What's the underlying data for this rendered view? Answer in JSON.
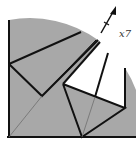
{
  "diagram": {
    "type": "origami-fold-step",
    "repeat_label": "x7",
    "colors": {
      "paper": "#a8a8a8",
      "line": "#111111",
      "crease": "#6e6e6e",
      "background": "#ffffff"
    }
  }
}
